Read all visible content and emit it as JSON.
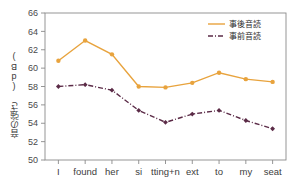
{
  "chart_data": {
    "type": "line",
    "title": "",
    "xlabel": "",
    "ylabel": "音の強さ (dB)",
    "ylim": [
      50,
      66
    ],
    "ytick_step": 2,
    "yticks": [
      50,
      52,
      54,
      56,
      58,
      60,
      62,
      64,
      66
    ],
    "grid": false,
    "legend_position": "top-right",
    "categories": [
      "I",
      "found",
      "her",
      "si",
      "tting+n",
      "ext",
      "to",
      "my",
      "seat"
    ],
    "series": [
      {
        "name": "事後音読",
        "color": "#e8a33d",
        "linestyle": "solid",
        "marker": "circle",
        "values": [
          60.8,
          63.0,
          61.5,
          58.0,
          57.9,
          58.4,
          59.5,
          58.8,
          58.5
        ]
      },
      {
        "name": "事前音読",
        "color": "#5b2b47",
        "linestyle": "dashdot",
        "marker": "diamond",
        "values": [
          58.0,
          58.2,
          57.6,
          55.4,
          54.1,
          55.0,
          55.4,
          54.3,
          53.4
        ]
      }
    ],
    "ytick_labels": [
      "50",
      "52",
      "54",
      "56",
      "58",
      "60",
      "62",
      "64",
      "66"
    ]
  },
  "legend": {
    "entries": [
      {
        "label": "事後音読"
      },
      {
        "label": "事前音読"
      }
    ]
  },
  "axes": {
    "y_title": "音の強さ (dB)"
  }
}
